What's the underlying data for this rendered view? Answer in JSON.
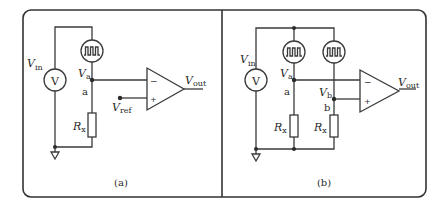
{
  "figure": {
    "panels": [
      {
        "id": "a",
        "caption": "(a)",
        "labels": {
          "vin_main": "V",
          "vin_sub": "in",
          "source_glyph": "V",
          "node_voltage_main": "V",
          "node_voltage_sub": "a",
          "node_name": "a",
          "resistor_main": "R",
          "resistor_sub": "x",
          "vref_main": "V",
          "vref_sub": "ref",
          "vout_main": "V",
          "vout_sub": "out",
          "opamp_minus": "−",
          "opamp_plus": "+"
        }
      },
      {
        "id": "b",
        "caption": "(b)",
        "labels": {
          "vin_main": "V",
          "vin_sub": "in",
          "source_glyph": "V",
          "node_a_voltage_main": "V",
          "node_a_voltage_sub": "a",
          "node_a_name": "a",
          "node_b_voltage_main": "V",
          "node_b_voltage_sub": "b",
          "node_b_name": "b",
          "resistor_a_main": "R",
          "resistor_a_sub": "x",
          "resistor_b_main": "R",
          "resistor_b_sub": "x",
          "vout_main": "V",
          "vout_sub": "out",
          "opamp_minus": "−",
          "opamp_plus": "+"
        }
      }
    ],
    "colors": {
      "line": "#3a3a3a",
      "background": "#ffffff"
    }
  }
}
